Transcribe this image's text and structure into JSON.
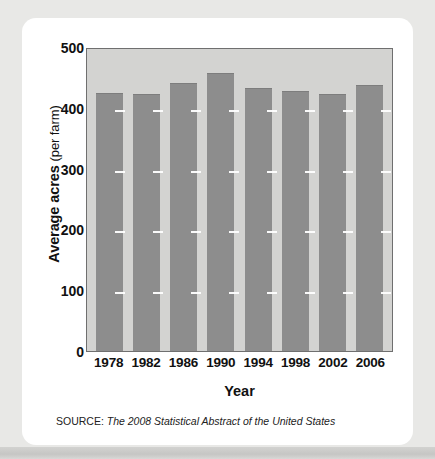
{
  "figure": {
    "source_label": "SOURCE:",
    "source_text": "The 2008 Statistical Abstract of the United States",
    "y_title_strong": "Average acres",
    "y_title_light": "(per farm)"
  },
  "chart_data": {
    "type": "bar",
    "title": "",
    "subtitle": "",
    "xlabel": "Year",
    "ylabel": "Average acres (per farm)",
    "categories": [
      "1978",
      "1982",
      "1986",
      "1990",
      "1994",
      "1998",
      "2002",
      "2006"
    ],
    "values": [
      427,
      425,
      443,
      460,
      436,
      431,
      426,
      441
    ],
    "series": [
      {
        "name": "Average acres per farm",
        "values": [
          427,
          425,
          443,
          460,
          436,
          431,
          426,
          441
        ]
      }
    ],
    "ylim": [
      0,
      500
    ],
    "yticks": [
      0,
      100,
      200,
      300,
      400,
      500
    ],
    "ytick_labels": [
      "0",
      "100",
      "200",
      "300",
      "400",
      "500"
    ],
    "grid": true,
    "grid_style": "dashed-white-horizontal",
    "legend": "none",
    "colors": {
      "bar": "#8d8d8d",
      "plot_background": "#d3d3d1",
      "plot_border": "#6f6f6f",
      "gridline": "#ffffff",
      "card_background": "#ffffff",
      "page_background": "#e8e8e6",
      "text": "#111111"
    }
  }
}
